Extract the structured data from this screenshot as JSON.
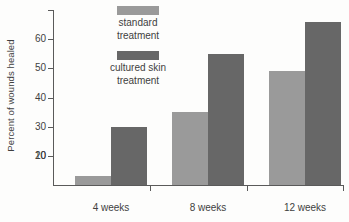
{
  "chart_data": {
    "type": "bar",
    "title": "",
    "xlabel": "",
    "ylabel": "Percent of wounds healed",
    "categories": [
      "4 weeks",
      "8 weeks",
      "12 weeks"
    ],
    "series": [
      {
        "name": "standard treatment",
        "color": "#9a9a9a",
        "values": [
          3,
          25,
          39
        ]
      },
      {
        "name": "cultured skin treatment",
        "color": "#676767",
        "values": [
          20,
          45,
          56
        ]
      }
    ],
    "ylim": [
      0,
      60
    ],
    "yticks": [
      10,
      20,
      30,
      40,
      50,
      60
    ],
    "ytick_labels": [
      "10",
      "20",
      "30",
      "40",
      "50",
      "60"
    ],
    "grid": false,
    "legend_position": "upper-left-inside"
  },
  "legend": {
    "entries": [
      {
        "swatch": "standard-swatch",
        "line1": "standard",
        "line2": "treatment"
      },
      {
        "swatch": "cultured-swatch",
        "line1": "cultured skin",
        "line2": "treatment"
      }
    ]
  },
  "axes": {
    "y_title": "Percent of wounds healed"
  }
}
